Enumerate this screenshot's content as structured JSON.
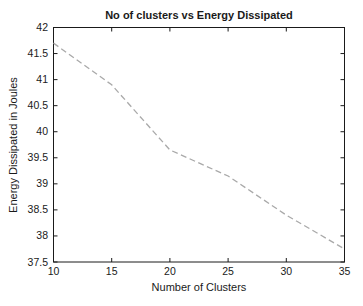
{
  "chart_data": {
    "type": "line",
    "title": "No of clusters vs Energy Dissipated",
    "xlabel": "Number of Clusters",
    "ylabel": "Energy Dissipated in Joules",
    "xlim": [
      10,
      35
    ],
    "ylim": [
      37.5,
      42
    ],
    "xticks": [
      10,
      15,
      20,
      25,
      30,
      35
    ],
    "yticks": [
      37.5,
      38,
      38.5,
      39,
      39.5,
      40,
      40.5,
      41,
      41.5,
      42
    ],
    "grid": false,
    "legend": "none",
    "axis_color": "#1a1a1a",
    "background_color": "#ffffff",
    "series": [
      {
        "name": "energy-dissipated",
        "x": [
          10,
          15,
          20,
          25,
          30,
          35
        ],
        "y": [
          41.7,
          40.9,
          39.65,
          39.15,
          38.4,
          37.75
        ],
        "line_style": "dashed",
        "color": "#a9a9a9"
      }
    ]
  }
}
